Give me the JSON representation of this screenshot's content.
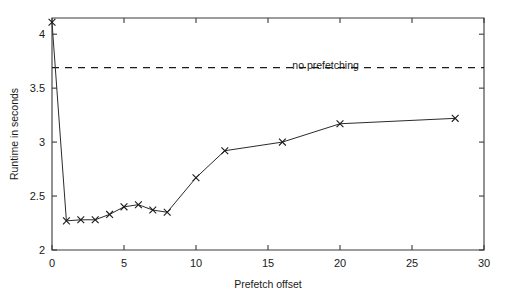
{
  "chart_data": {
    "type": "line",
    "title": "",
    "xlabel": "Prefetch offset",
    "ylabel": "Runtime in seconds",
    "xlim": [
      0,
      30
    ],
    "ylim": [
      2,
      4.15
    ],
    "grid": false,
    "legend_position": "none",
    "xticks": [
      0,
      5,
      10,
      15,
      20,
      25,
      30
    ],
    "xticklabels": [
      "0",
      "5",
      "10",
      "15",
      "20",
      "25",
      "30"
    ],
    "yticks": [
      2,
      2.5,
      3,
      3.5,
      4
    ],
    "yticklabels": [
      "2",
      "2.5",
      "3",
      "3.5",
      "4"
    ],
    "series": [
      {
        "name": "prefetching",
        "marker": "x",
        "linestyle": "solid",
        "x": [
          0,
          1,
          2,
          3,
          4,
          5,
          6,
          7,
          8,
          10,
          12,
          16,
          20,
          28
        ],
        "values": [
          4.11,
          2.27,
          2.28,
          2.28,
          2.33,
          2.4,
          2.42,
          2.37,
          2.35,
          2.67,
          2.92,
          3.0,
          3.17,
          3.22
        ]
      }
    ],
    "annotations": [
      {
        "name": "no-prefetching-reference",
        "label": "no prefetching",
        "y": 3.69,
        "linestyle": "dashed",
        "label_x": 19.0
      }
    ]
  }
}
